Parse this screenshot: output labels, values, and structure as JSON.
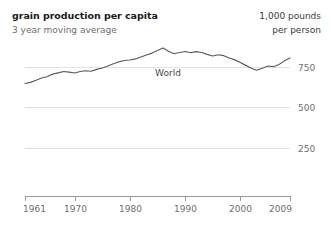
{
  "header": {
    "title": "grain production per capita",
    "subtitle": "3 year moving average",
    "unit_line1": "1,000 pounds",
    "unit_line2": "per person"
  },
  "chart_data": {
    "type": "line",
    "title": "grain production per capita",
    "subtitle": "3 year moving average",
    "xlabel": "",
    "ylabel": "1,000 pounds per person",
    "xlim": [
      1961,
      2009
    ],
    "ylim": [
      0,
      875
    ],
    "grid": true,
    "legend_position": "inline",
    "yticks": [
      250,
      500,
      750
    ],
    "ytick_labels": [
      "250",
      "500",
      "750"
    ],
    "xticks": [
      1961,
      1970,
      1980,
      1990,
      2000,
      2009
    ],
    "xtick_labels": [
      "1961",
      "1970",
      "1980",
      "1990",
      "2000",
      "2009"
    ],
    "series": [
      {
        "name": "World",
        "label": "World",
        "color": "#5b5b5b",
        "x": [
          1961,
          1962,
          1963,
          1964,
          1965,
          1966,
          1967,
          1968,
          1969,
          1970,
          1971,
          1972,
          1973,
          1974,
          1975,
          1976,
          1977,
          1978,
          1979,
          1980,
          1981,
          1982,
          1983,
          1984,
          1985,
          1986,
          1987,
          1988,
          1989,
          1990,
          1991,
          1992,
          1993,
          1994,
          1995,
          1996,
          1997,
          1998,
          1999,
          2000,
          2001,
          2002,
          2003,
          2004,
          2005,
          2006,
          2007,
          2008,
          2009
        ],
        "values": [
          648,
          655,
          668,
          682,
          690,
          706,
          714,
          722,
          718,
          713,
          722,
          727,
          724,
          735,
          744,
          756,
          770,
          782,
          790,
          793,
          800,
          812,
          824,
          836,
          852,
          868,
          848,
          832,
          840,
          846,
          838,
          845,
          840,
          828,
          818,
          826,
          820,
          806,
          794,
          778,
          760,
          742,
          730,
          742,
          756,
          752,
          766,
          788,
          806
        ]
      }
    ]
  }
}
